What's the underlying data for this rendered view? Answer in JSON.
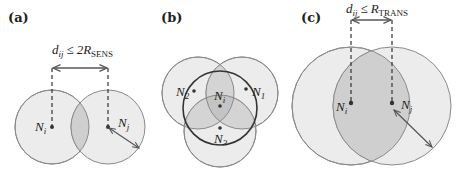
{
  "figure": {
    "panels": [
      {
        "id": "a",
        "label": "(a)",
        "constraint": {
          "lhs": "d",
          "lhs_sub": "ij",
          "op": "≤",
          "rhs_prefix": "2R",
          "rhs_sub": "SENS"
        },
        "nodes": [
          {
            "name": "N",
            "sub": "i"
          },
          {
            "name": "N",
            "sub": "j"
          }
        ]
      },
      {
        "id": "b",
        "label": "(b)",
        "nodes": [
          {
            "name": "N",
            "sub": "2"
          },
          {
            "name": "N",
            "sub": "i"
          },
          {
            "name": "N",
            "sub": "1"
          },
          {
            "name": "N",
            "sub": "3"
          }
        ]
      },
      {
        "id": "c",
        "label": "(c)",
        "constraint": {
          "lhs": "d",
          "lhs_sub": "ij",
          "op": "≤",
          "rhs_prefix": "R",
          "rhs_sub": "TRANS"
        },
        "nodes": [
          {
            "name": "N",
            "sub": "i"
          },
          {
            "name": "N",
            "sub": "j"
          }
        ]
      }
    ],
    "colors": {
      "circle_fill": "#ececec",
      "overlap_fill": "#cfcfcf",
      "stroke": "#8a8a8a",
      "ink": "#222222"
    }
  }
}
